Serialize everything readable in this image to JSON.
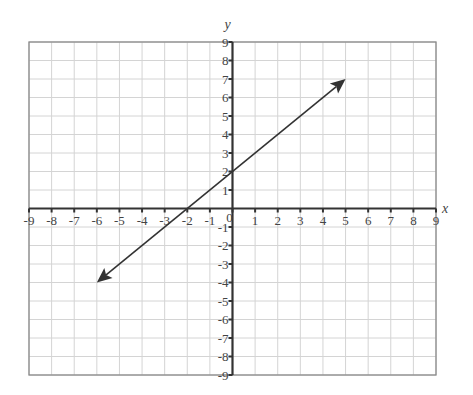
{
  "chart_data": {
    "type": "line",
    "title": "",
    "xlabel": "x",
    "ylabel": "y",
    "xlim": [
      -9,
      9
    ],
    "ylim": [
      -9,
      9
    ],
    "grid": true,
    "x_ticks": [
      -9,
      -8,
      -7,
      -6,
      -5,
      -4,
      -3,
      -2,
      -1,
      0,
      1,
      2,
      3,
      4,
      5,
      6,
      7,
      8,
      9
    ],
    "y_ticks": [
      -9,
      -8,
      -7,
      -6,
      -5,
      -4,
      -3,
      -2,
      -1,
      1,
      2,
      3,
      4,
      5,
      6,
      7,
      8,
      9
    ],
    "series": [
      {
        "name": "y = x + 2",
        "equation": "y = x + 2",
        "points": [
          [
            -6,
            -4
          ],
          [
            -2,
            0
          ],
          [
            0,
            2
          ],
          [
            5,
            7
          ]
        ],
        "arrows": "both ends",
        "color": "#333333"
      }
    ],
    "origin_label": "0"
  },
  "colors": {
    "grid": "#d4d4d4",
    "axis": "#333333",
    "border": "#8a8a8a",
    "text": "#444444",
    "line": "#333333"
  }
}
